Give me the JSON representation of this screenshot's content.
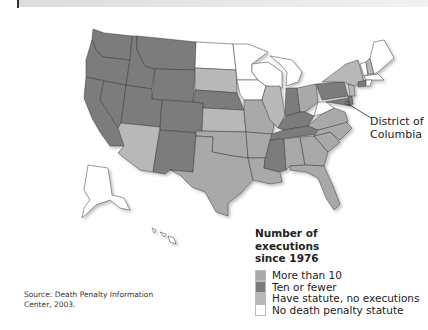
{
  "colors": {
    "more_than_10": "#a9a9a9",
    "ten_or_fewer": "#7c7c7c",
    "statute_no_exec": "#b8b8b8",
    "no_statute": "#ffffff"
  },
  "map": {
    "callout_label": "District of Columbia",
    "callout_line1": "District of",
    "callout_line2": "Columbia"
  },
  "legend": {
    "title_line1": "Number of",
    "title_line2": "executions",
    "title_line3": "since 1976",
    "items": [
      {
        "label": "More than 10",
        "category": "more_than_10"
      },
      {
        "label": "Ten or fewer",
        "category": "ten_or_fewer"
      },
      {
        "label": "Have statute, no executions",
        "category": "statute_no_exec"
      },
      {
        "label": "No death penalty statute",
        "category": "no_statute"
      }
    ]
  },
  "source": {
    "line1": "Source: Death Penalty Information",
    "line2": "Center, 2003."
  }
}
